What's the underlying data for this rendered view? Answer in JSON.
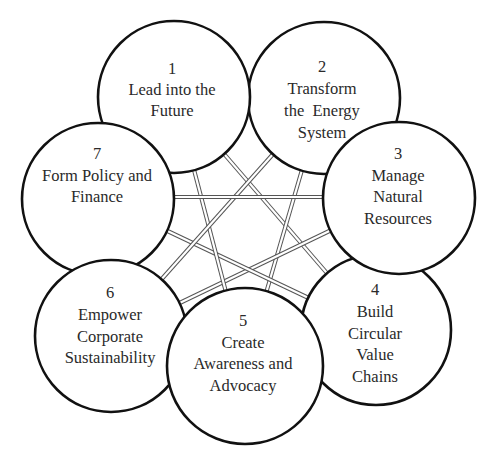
{
  "diagram": {
    "type": "circle-network",
    "line_color": "#555555",
    "circle_stroke": "#111111",
    "text_color": "#2a2a2a",
    "nodes": [
      {
        "number": "1",
        "lines": [
          "Lead into the",
          "Future"
        ]
      },
      {
        "number": "2",
        "lines": [
          "Transform",
          "the  Energy",
          "System"
        ]
      },
      {
        "number": "3",
        "lines": [
          "Manage",
          "Natural",
          "Resources"
        ]
      },
      {
        "number": "4",
        "lines": [
          "Build",
          "Circular",
          "Value",
          "Chains"
        ]
      },
      {
        "number": "5",
        "lines": [
          "Create",
          "Awareness and",
          "Advocacy"
        ]
      },
      {
        "number": "6",
        "lines": [
          "Empower",
          "Corporate",
          "Sustainability"
        ]
      },
      {
        "number": "7",
        "lines": [
          "Form Policy and",
          "Finance"
        ]
      }
    ],
    "connections": [
      [
        "1",
        "4"
      ],
      [
        "2",
        "5"
      ],
      [
        "3",
        "6"
      ],
      [
        "4",
        "7"
      ],
      [
        "5",
        "1"
      ],
      [
        "6",
        "2"
      ],
      [
        "7",
        "3"
      ]
    ]
  }
}
